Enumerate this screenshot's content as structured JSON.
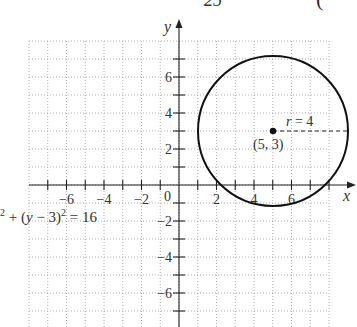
{
  "figure": {
    "top_clipped_text": {
      "fraction_denominator": "25",
      "paren": "("
    },
    "axes": {
      "x_label": "x",
      "y_label": "y"
    },
    "x_ticks": [
      {
        "value": -6,
        "label": "−6"
      },
      {
        "value": -4,
        "label": "−4"
      },
      {
        "value": -2,
        "label": "−2"
      },
      {
        "value": 2,
        "label": "2"
      },
      {
        "value": 4,
        "label": "4"
      },
      {
        "value": 6,
        "label": "6"
      }
    ],
    "y_ticks": [
      {
        "value": 6,
        "label": "6"
      },
      {
        "value": 4,
        "label": "4"
      },
      {
        "value": 2,
        "label": "2"
      },
      {
        "value": -2,
        "label": "−2"
      },
      {
        "value": -4,
        "label": "−4"
      },
      {
        "value": -6,
        "label": "−6"
      }
    ],
    "origin_label": "0",
    "center_label": "(5, 3)",
    "radius_label": "r = 4",
    "equation": {
      "prefix_sup": "2",
      "part1": " + (",
      "var": "y",
      "part2": " − 3)",
      "sup": "2",
      "part3": " = 16"
    }
  },
  "chart_data": {
    "type": "scatter",
    "title": "",
    "xlabel": "x",
    "ylabel": "y",
    "xlim": [
      -8,
      8
    ],
    "ylim": [
      -8,
      8
    ],
    "grid": true,
    "shapes": [
      {
        "kind": "circle",
        "center": [
          5,
          3
        ],
        "radius": 4,
        "equation": "(x − 5)² + (y − 3)² = 16"
      }
    ],
    "points": [
      {
        "x": 5,
        "y": 3,
        "label": "(5, 3)"
      }
    ],
    "annotations": [
      "r = 4",
      "(5, 3)",
      "(x − 5)² + (y − 3)² = 16"
    ]
  }
}
